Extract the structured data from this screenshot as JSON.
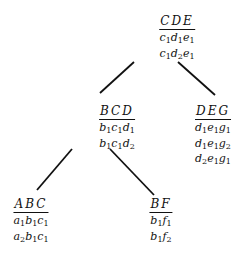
{
  "diagram": {
    "type": "tree",
    "nodes": [
      {
        "id": "CDE",
        "header": "CDE",
        "rows": [
          [
            "c",
            "1",
            "d",
            "1",
            "e",
            "1"
          ],
          [
            "c",
            "1",
            "d",
            "2",
            "e",
            "1"
          ]
        ],
        "x": 177,
        "y": 10
      },
      {
        "id": "BCD",
        "header": "BCD",
        "rows": [
          [
            "b",
            "1",
            "c",
            "1",
            "d",
            "1"
          ],
          [
            "b",
            "1",
            "c",
            "1",
            "d",
            "2"
          ]
        ],
        "x": 117,
        "y": 100
      },
      {
        "id": "DEG",
        "header": "DEG",
        "rows": [
          [
            "d",
            "1",
            "e",
            "1",
            "g",
            "1"
          ],
          [
            "d",
            "1",
            "e",
            "1",
            "g",
            "2"
          ],
          [
            "d",
            "2",
            "e",
            "1",
            "g",
            "1"
          ]
        ],
        "x": 213,
        "y": 100
      },
      {
        "id": "ABC",
        "header": "ABC",
        "rows": [
          [
            "a",
            "1",
            "b",
            "1",
            "c",
            "1"
          ],
          [
            "a",
            "2",
            "b",
            "1",
            "c",
            "1"
          ]
        ],
        "x": 31,
        "y": 193
      },
      {
        "id": "BF",
        "header": "BF",
        "rows": [
          [
            "b",
            "1",
            "f",
            "1"
          ],
          [
            "b",
            "1",
            "f",
            "2"
          ]
        ],
        "x": 161,
        "y": 193
      }
    ],
    "edges": [
      {
        "from": "CDE",
        "to": "BCD",
        "x1": 134,
        "y1": 62,
        "x2": 100,
        "y2": 93
      },
      {
        "from": "CDE",
        "to": "DEG",
        "x1": 178,
        "y1": 62,
        "x2": 215,
        "y2": 95
      },
      {
        "from": "BCD",
        "to": "ABC",
        "x1": 72,
        "y1": 149,
        "x2": 37,
        "y2": 190
      },
      {
        "from": "BCD",
        "to": "BF",
        "x1": 110,
        "y1": 149,
        "x2": 154,
        "y2": 195
      }
    ]
  }
}
